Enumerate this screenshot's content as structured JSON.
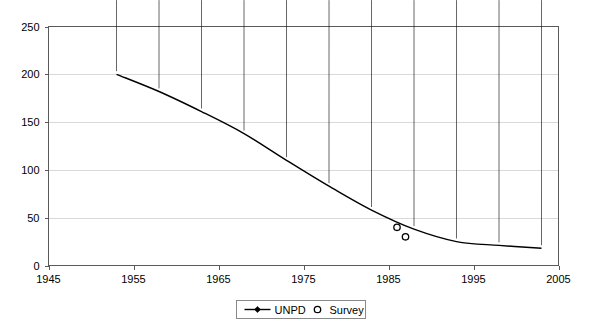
{
  "chart_data": {
    "type": "line",
    "title": "",
    "xlabel": "",
    "ylabel": "",
    "xlim": [
      1945,
      2005
    ],
    "ylim": [
      0,
      250
    ],
    "xticks": [
      1945,
      1955,
      1965,
      1975,
      1985,
      1995,
      2005
    ],
    "yticks": [
      0,
      50,
      100,
      150,
      200,
      250
    ],
    "xtick_labels": [
      "1945",
      "1955",
      "1965",
      "1975",
      "1985",
      "1995",
      "2005"
    ],
    "ytick_labels": [
      "0",
      "50",
      "100",
      "150",
      "200",
      "250"
    ],
    "grid": "horizontal",
    "legend_position": "bottom-center",
    "series": [
      {
        "name": "UNPD",
        "marker": "diamond",
        "line": true,
        "color": "#000000",
        "points": [
          {
            "x": 1953,
            "y": 200
          },
          {
            "x": 1958,
            "y": 182
          },
          {
            "x": 1963,
            "y": 161
          },
          {
            "x": 1968,
            "y": 138
          },
          {
            "x": 1973,
            "y": 110
          },
          {
            "x": 1978,
            "y": 83
          },
          {
            "x": 1983,
            "y": 58
          },
          {
            "x": 1988,
            "y": 38
          },
          {
            "x": 1993,
            "y": 25
          },
          {
            "x": 1998,
            "y": 21
          },
          {
            "x": 2003,
            "y": 18
          }
        ]
      },
      {
        "name": "Survey",
        "marker": "open-circle",
        "line": false,
        "color": "#000000",
        "points": [
          {
            "x": 1986,
            "y": 40
          },
          {
            "x": 1987,
            "y": 30
          }
        ]
      }
    ]
  },
  "legend": {
    "items": [
      {
        "label": "UNPD",
        "marker": "line-diamond"
      },
      {
        "label": "Survey",
        "marker": "open-circle"
      }
    ]
  },
  "colors": {
    "series": "#000000",
    "grid": "#d9d9d9",
    "axis": "#5a5a5a",
    "background": "#ffffff"
  }
}
